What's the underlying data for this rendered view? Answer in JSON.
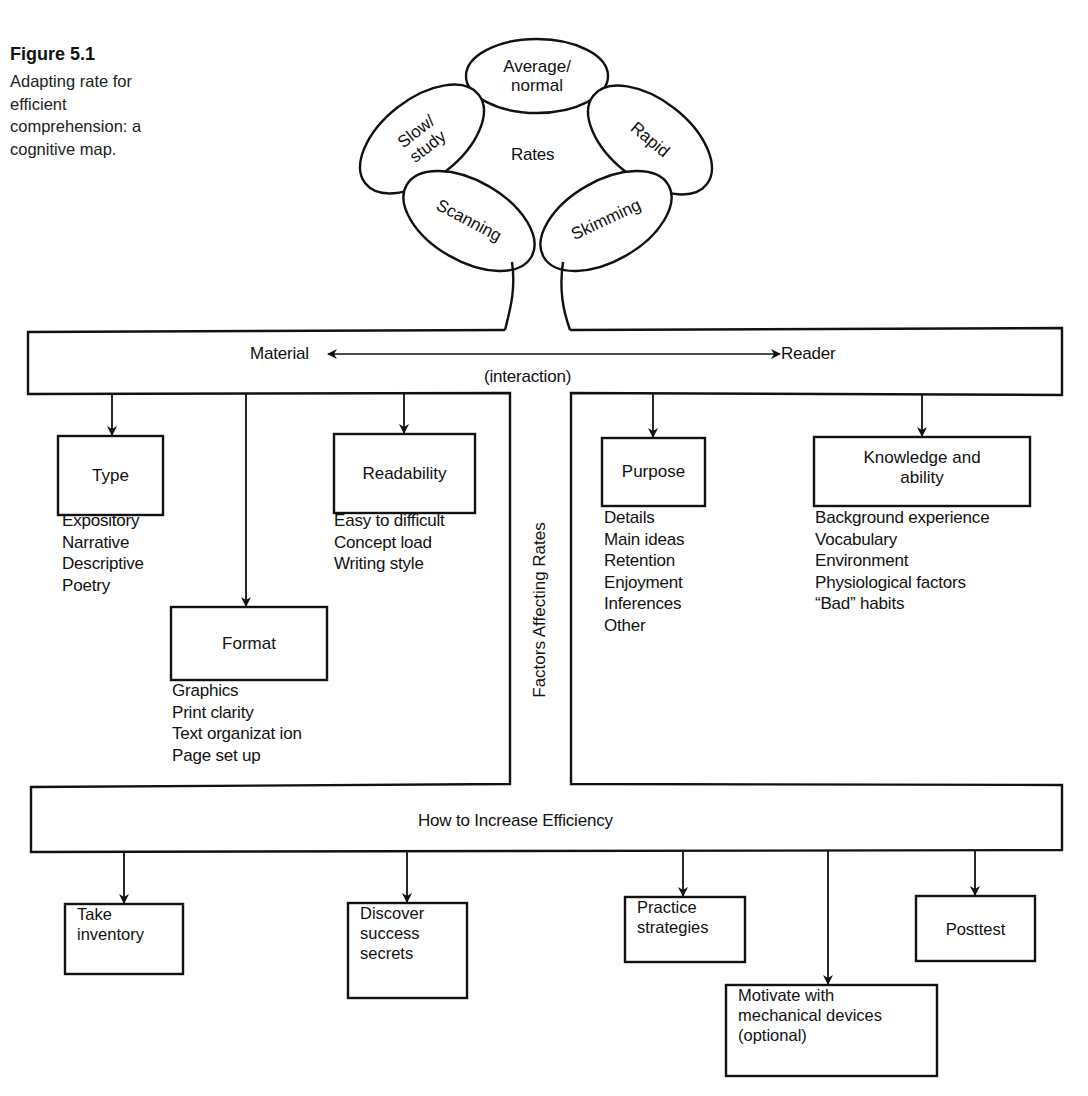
{
  "caption": {
    "figure_label": "Figure 5.1",
    "lines": [
      "Adapting rate for",
      "efficient",
      "comprehension: a",
      "cognitive map."
    ]
  },
  "rates_cluster": {
    "center_label": "Rates",
    "ellipses": [
      {
        "id": "average",
        "lines": [
          "Average/",
          "normal"
        ]
      },
      {
        "id": "slow",
        "lines": [
          "Slow/",
          "study"
        ]
      },
      {
        "id": "rapid",
        "lines": [
          "Rapid"
        ]
      },
      {
        "id": "scanning",
        "lines": [
          "Scanning"
        ]
      },
      {
        "id": "skimming",
        "lines": [
          "Skimming"
        ]
      }
    ]
  },
  "interaction_bar": {
    "left_label": "Material",
    "right_label": "Reader",
    "sub_label": "(interaction)"
  },
  "factors_label": "Factors Affecting Rates",
  "material": {
    "boxes": [
      {
        "id": "type",
        "label": "Type",
        "items": [
          "Expository",
          "Narrative",
          "Descriptive",
          "Poetry"
        ]
      },
      {
        "id": "readability",
        "label": "Readability",
        "items": [
          "Easy to difficult",
          "Concept load",
          "Writing style"
        ]
      },
      {
        "id": "format",
        "label": "Format",
        "items": [
          "Graphics",
          "Print clarity",
          "Text organizat ion",
          "Page set up"
        ]
      }
    ]
  },
  "reader": {
    "boxes": [
      {
        "id": "purpose",
        "label": "Purpose",
        "items": [
          "Details",
          "Main ideas",
          "Retention",
          "Enjoyment",
          "Inferences",
          "Other"
        ]
      },
      {
        "id": "knowledge",
        "label_lines": [
          "Knowledge and",
          "ability"
        ],
        "items": [
          "Background experience",
          "Vocabulary",
          "Environment",
          "Physiological factors",
          "“Bad” habits"
        ]
      }
    ]
  },
  "efficiency": {
    "title": "How to Increase Efficiency",
    "steps": [
      {
        "id": "inventory",
        "lines": [
          "Take",
          "inventory"
        ]
      },
      {
        "id": "discover",
        "lines": [
          "Discover",
          "success",
          "secrets"
        ]
      },
      {
        "id": "practice",
        "lines": [
          "Practice",
          "strategies"
        ]
      },
      {
        "id": "motivate",
        "lines": [
          "Motivate with",
          "mechanical devices",
          "(optional)"
        ]
      },
      {
        "id": "posttest",
        "lines": [
          "Posttest"
        ]
      }
    ]
  },
  "colors": {
    "ink": "#111111",
    "background": "#ffffff"
  }
}
